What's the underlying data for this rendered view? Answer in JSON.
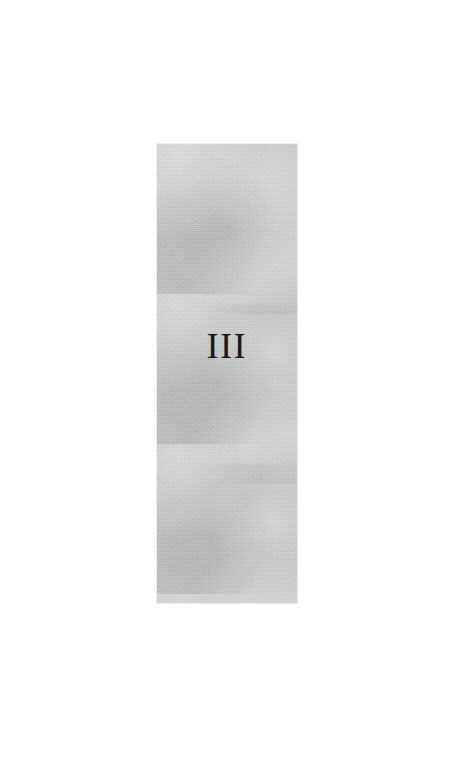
{
  "document": {
    "page_type": "part-divider",
    "background_color": "#ffffff"
  },
  "panel": {
    "name": "tint-panel",
    "fill_color": "#c4c4c4",
    "x": 157,
    "y": 144,
    "width": 140,
    "height": 459
  },
  "part": {
    "number_label": "III",
    "numeral_color": "#1a1a1a"
  }
}
